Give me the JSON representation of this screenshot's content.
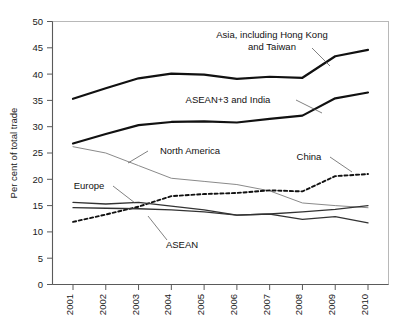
{
  "chart_data": {
    "type": "line",
    "title": "",
    "subtitle": "",
    "xlabel": "",
    "ylabel": "Per cent of total trade",
    "x": [
      2001,
      2002,
      2003,
      2004,
      2005,
      2006,
      2007,
      2008,
      2009,
      2010
    ],
    "categories": [
      "2001",
      "2002",
      "2003",
      "2004",
      "2005",
      "2006",
      "2007",
      "2008",
      "2009",
      "2010"
    ],
    "xlim": [
      2001,
      2010
    ],
    "ylim": [
      0,
      50
    ],
    "yticks": [
      0,
      5,
      10,
      15,
      20,
      25,
      30,
      35,
      40,
      45,
      50
    ],
    "ytick_labels": [
      "0",
      "5",
      "10",
      "15",
      "20",
      "25",
      "30",
      "35",
      "40",
      "45",
      "50"
    ],
    "grid": false,
    "legend_position": "inline-annotations",
    "series": [
      {
        "name": "Asia, including Hong Kong and Taiwan",
        "style": "solid-thick",
        "color": "#111111",
        "width": 2.2,
        "values": [
          35.3,
          37.3,
          39.2,
          40.1,
          39.9,
          39.1,
          39.5,
          39.3,
          43.4,
          44.6
        ]
      },
      {
        "name": "ASEAN+3 and India",
        "style": "solid-thick",
        "color": "#111111",
        "width": 2.2,
        "values": [
          26.8,
          28.6,
          30.3,
          30.9,
          31.0,
          30.8,
          31.5,
          32.1,
          35.4,
          36.5
        ]
      },
      {
        "name": "North America",
        "style": "solid-thin",
        "color": "#8a8a8a",
        "width": 1.0,
        "values": [
          26.2,
          25.0,
          22.6,
          20.2,
          19.6,
          19.0,
          17.8,
          15.5,
          15.0,
          14.6
        ]
      },
      {
        "name": "China",
        "style": "dashed",
        "color": "#111111",
        "width": 1.9,
        "values": [
          11.9,
          13.3,
          14.8,
          16.8,
          17.2,
          17.4,
          17.9,
          17.7,
          20.6,
          21.0
        ]
      },
      {
        "name": "Europe",
        "style": "solid-medium",
        "color": "#333333",
        "width": 1.3,
        "values": [
          15.6,
          15.3,
          15.6,
          14.9,
          14.2,
          13.2,
          13.4,
          12.4,
          12.9,
          11.7
        ]
      },
      {
        "name": "ASEAN",
        "style": "solid-medium",
        "color": "#333333",
        "width": 1.3,
        "values": [
          14.6,
          14.5,
          14.4,
          14.2,
          13.8,
          13.2,
          13.4,
          13.8,
          14.3,
          15.0
        ]
      }
    ],
    "annotations": [
      {
        "id": "asia",
        "text_lines": [
          "Asia, including Hong Kong",
          "and Taiwan"
        ],
        "text_x": 272,
        "text_y": 38,
        "anchor": "middle",
        "leader": [
          [
            312,
            48
          ],
          [
            330,
            66
          ]
        ]
      },
      {
        "id": "asean3",
        "text_lines": [
          "ASEAN+3 and India"
        ],
        "text_x": 228,
        "text_y": 103,
        "anchor": "middle",
        "leader": [
          [
            296,
            100
          ],
          [
            322,
            113
          ]
        ]
      },
      {
        "id": "north-america",
        "text_lines": [
          "North America"
        ],
        "text_x": 190,
        "text_y": 154,
        "anchor": "middle",
        "leader": [
          [
            148,
            151
          ],
          [
            128,
            163
          ]
        ]
      },
      {
        "id": "china",
        "text_lines": [
          "China"
        ],
        "text_x": 309,
        "text_y": 160,
        "anchor": "middle",
        "leader": [
          [
            330,
            157
          ],
          [
            352,
            172
          ]
        ]
      },
      {
        "id": "europe",
        "text_lines": [
          "Europe"
        ],
        "text_x": 89,
        "text_y": 189,
        "anchor": "middle",
        "leader": [
          [
            113,
            186
          ],
          [
            135,
            203
          ]
        ]
      },
      {
        "id": "asean",
        "text_lines": [
          "ASEAN"
        ],
        "text_x": 182,
        "text_y": 248,
        "anchor": "middle",
        "leader": [
          [
            167,
            240
          ],
          [
            148,
            216
          ]
        ]
      }
    ]
  }
}
